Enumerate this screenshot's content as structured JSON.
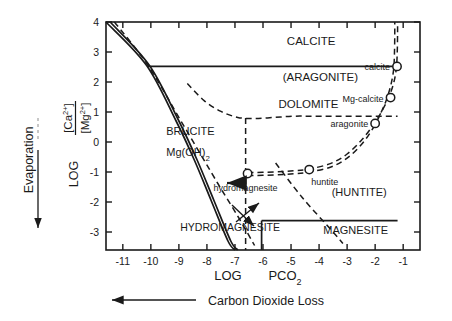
{
  "figure": {
    "y_axis_label_main": "LOG",
    "y_axis_label_num": "[Ca",
    "y_axis_label_num_sup": "2+",
    "y_axis_label_num_end": "]",
    "y_axis_label_den": "[Mg",
    "y_axis_label_den_sup": "2+",
    "y_axis_label_den_end": "]",
    "x_axis_label_main": "LOG",
    "x_axis_label_sub": "PCO",
    "x_axis_label_subscript": "2",
    "left_arrow_label": "Evaporation",
    "bottom_arrow_label": "Carbon  Dioxide  Loss"
  },
  "chart_data": {
    "type": "line",
    "title": "",
    "xlabel": "LOG PCO2",
    "ylabel": "LOG [Ca2+]/[Mg2+]",
    "xlim": [
      -11.6,
      -0.4
    ],
    "ylim": [
      -3.6,
      4.0
    ],
    "grid": false,
    "legend": "none",
    "xticks": [
      -11,
      -10,
      -9,
      -8,
      -7,
      -6,
      -5,
      -4,
      -3,
      -2,
      -1
    ],
    "xticklabels": [
      "-11",
      "-10",
      "-9",
      "-8",
      "-7",
      "-6",
      "-5",
      "-4",
      "-3",
      "-2",
      "-1"
    ],
    "yticks": [
      4,
      3,
      2,
      1,
      0,
      -1,
      -2,
      -3
    ],
    "yticklabels": [
      "4",
      "3",
      "2",
      "1",
      "0",
      "-1",
      "-2",
      "-3"
    ],
    "field_labels": [
      {
        "name": "CALCITE",
        "x": -5.15,
        "y": 3.25,
        "size": 11.5,
        "style": "plain"
      },
      {
        "name": "(ARAGONITE)",
        "x": -5.3,
        "y": 2.05,
        "size": 11.5,
        "style": "plain"
      },
      {
        "name": "DOLOMITE",
        "x": -5.45,
        "y": 1.15,
        "size": 11.5,
        "style": "plain"
      },
      {
        "name": "BRUCITE",
        "x": -9.45,
        "y": 0.25,
        "size": 11.0,
        "style": "plain"
      },
      {
        "name": "Mg(OH)",
        "x": -9.45,
        "y": -0.45,
        "size": 11.0,
        "style": "sub2"
      },
      {
        "name": "HYDROMAGNESITE",
        "x": -8.95,
        "y": -2.95,
        "size": 10.5,
        "style": "plain"
      },
      {
        "name": "(HUNTITE)",
        "x": -3.55,
        "y": -1.8,
        "size": 11.0,
        "style": "plain"
      },
      {
        "name": "MAGNESITE",
        "x": -3.85,
        "y": -3.05,
        "size": 11.0,
        "style": "plain"
      }
    ],
    "path_points": [
      {
        "name": "calcite",
        "x": -1.22,
        "y": 2.52
      },
      {
        "name": "Mg-calcite",
        "x": -1.45,
        "y": 1.48
      },
      {
        "name": "aragonite",
        "x": -2.0,
        "y": 0.62
      },
      {
        "name": "huntite",
        "x": -4.35,
        "y": -0.92
      },
      {
        "name": "hydromagnesite",
        "x": -6.55,
        "y": -1.05
      }
    ],
    "series": [
      {
        "name": "evolution_path_upper",
        "style": "dashed",
        "points": [
          [
            -6.55,
            -1.02
          ],
          [
            -5.6,
            -1.0
          ],
          [
            -4.9,
            -0.96
          ],
          [
            -4.35,
            -0.9
          ],
          [
            -3.6,
            -0.72
          ],
          [
            -3.0,
            -0.4
          ],
          [
            -2.45,
            0.1
          ],
          [
            -2.0,
            0.66
          ],
          [
            -1.72,
            1.1
          ],
          [
            -1.5,
            1.52
          ],
          [
            -1.33,
            2.0
          ],
          [
            -1.24,
            2.5
          ],
          [
            -1.21,
            3.05
          ],
          [
            -1.2,
            3.65
          ],
          [
            -1.2,
            4.0
          ]
        ]
      },
      {
        "name": "evolution_path_lower",
        "style": "dashed",
        "points": [
          [
            -6.55,
            -1.12
          ],
          [
            -5.6,
            -1.1
          ],
          [
            -4.9,
            -1.06
          ],
          [
            -4.35,
            -1.0
          ],
          [
            -3.6,
            -0.84
          ],
          [
            -3.0,
            -0.54
          ],
          [
            -2.45,
            -0.04
          ],
          [
            -2.05,
            0.5
          ],
          [
            -1.8,
            0.96
          ],
          [
            -1.6,
            1.4
          ],
          [
            -1.44,
            1.9
          ],
          [
            -1.34,
            2.42
          ],
          [
            -1.31,
            3.0
          ],
          [
            -1.3,
            3.62
          ],
          [
            -1.3,
            4.0
          ]
        ]
      },
      {
        "name": "brucite_boundary_solid",
        "style": "solid",
        "points": [
          [
            -11.6,
            4.0
          ],
          [
            -10.15,
            2.55
          ],
          [
            -9.1,
            0.7
          ],
          [
            -8.45,
            -0.6
          ],
          [
            -7.85,
            -1.95
          ],
          [
            -7.25,
            -3.3
          ],
          [
            -7.0,
            -3.6
          ]
        ]
      },
      {
        "name": "brucite_boundary_solid_2",
        "style": "solid",
        "points": [
          [
            -11.45,
            4.0
          ],
          [
            -10.05,
            2.55
          ],
          [
            -9.0,
            0.7
          ],
          [
            -8.35,
            -0.6
          ],
          [
            -7.75,
            -1.95
          ],
          [
            -7.15,
            -3.3
          ],
          [
            -6.9,
            -3.6
          ]
        ]
      },
      {
        "name": "dolomite_dashed_diagonal",
        "style": "dashed",
        "points": [
          [
            -11.3,
            4.0
          ],
          [
            -10.1,
            2.55
          ],
          [
            -8.8,
            0.5
          ],
          [
            -7.6,
            -1.4
          ],
          [
            -6.85,
            -2.55
          ],
          [
            -6.3,
            -3.45
          ]
        ]
      },
      {
        "name": "calcite_aragonite_boundary",
        "style": "solid",
        "points": [
          [
            -10.12,
            2.52
          ],
          [
            -1.22,
            2.52
          ]
        ]
      },
      {
        "name": "dolomite_lower_curve",
        "style": "dashed",
        "points": [
          [
            -8.7,
            1.95
          ],
          [
            -8.1,
            1.38
          ],
          [
            -7.5,
            1.02
          ],
          [
            -6.9,
            0.82
          ],
          [
            -6.3,
            0.78
          ],
          [
            -5.6,
            0.82
          ],
          [
            -4.9,
            0.86
          ],
          [
            -4.2,
            0.86
          ],
          [
            -3.0,
            0.86
          ],
          [
            -1.2,
            0.86
          ]
        ]
      },
      {
        "name": "dolomite_vertical_dashed",
        "style": "dashed",
        "points": [
          [
            -6.62,
            0.8
          ],
          [
            -6.62,
            -3.6
          ]
        ]
      },
      {
        "name": "magnesite_top",
        "style": "solid",
        "points": [
          [
            -6.05,
            -2.62
          ],
          [
            -1.2,
            -2.62
          ]
        ]
      },
      {
        "name": "magnesite_left",
        "style": "solid",
        "points": [
          [
            -6.05,
            -2.62
          ],
          [
            -6.05,
            -3.6
          ]
        ]
      },
      {
        "name": "huntite_dashed_diagonal",
        "style": "dashed",
        "points": [
          [
            -5.55,
            -0.7
          ],
          [
            -4.6,
            -1.85
          ],
          [
            -3.55,
            -2.95
          ],
          [
            -3.15,
            -3.38
          ]
        ]
      }
    ],
    "arrows": [
      {
        "name": "evaporation-arrow",
        "dir": "down"
      },
      {
        "name": "co2-loss-arrow",
        "dir": "left"
      },
      {
        "name": "path-start-arrow",
        "dir": "left"
      },
      {
        "name": "crossing-arrow-up",
        "dir": "up-right"
      },
      {
        "name": "crossing-arrow-down",
        "dir": "down-right"
      }
    ]
  }
}
